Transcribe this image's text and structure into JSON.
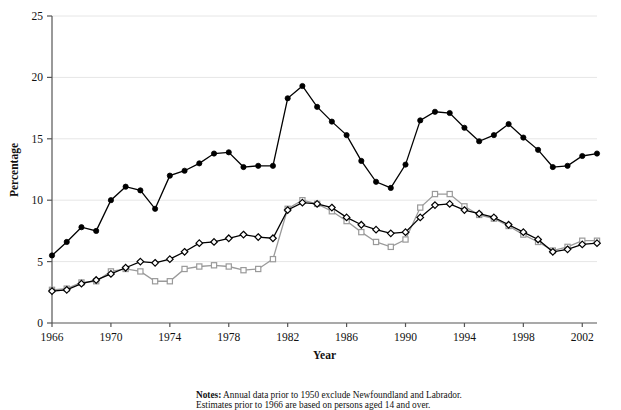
{
  "chart_data": {
    "type": "line",
    "title": "",
    "xlabel": "Year",
    "ylabel": "Percentage",
    "xlim": [
      1966,
      2003
    ],
    "ylim": [
      0,
      25
    ],
    "yticks": [
      0,
      5,
      10,
      15,
      20,
      25
    ],
    "xticks": [
      1966,
      1970,
      1974,
      1978,
      1982,
      1986,
      1990,
      1994,
      1998,
      2002
    ],
    "grid": "horizontal",
    "legend_position": "bottom",
    "x": [
      1966,
      1967,
      1968,
      1969,
      1970,
      1971,
      1972,
      1973,
      1974,
      1975,
      1976,
      1977,
      1978,
      1979,
      1980,
      1981,
      1982,
      1983,
      1984,
      1985,
      1986,
      1987,
      1988,
      1989,
      1990,
      1991,
      1992,
      1993,
      1994,
      1995,
      1996,
      1997,
      1998,
      1999,
      2000,
      2001,
      2002,
      2003
    ],
    "series": [
      {
        "name": "Youth 15-24",
        "marker": "filled-circle",
        "color": "#000000",
        "values": [
          5.5,
          6.6,
          7.8,
          7.5,
          10.0,
          11.1,
          10.8,
          9.3,
          12.0,
          12.4,
          13.0,
          13.8,
          13.9,
          12.7,
          12.8,
          12.8,
          18.3,
          19.3,
          17.6,
          16.4,
          15.3,
          13.2,
          11.5,
          11.0,
          12.9,
          16.5,
          17.2,
          17.1,
          15.9,
          14.8,
          15.3,
          16.2,
          15.1,
          14.1,
          12.7,
          12.8,
          13.6,
          13.8
        ]
      },
      {
        "name": "Men 25+",
        "marker": "open-square",
        "color": "#9a9a9a",
        "values": [
          2.7,
          2.8,
          3.3,
          3.4,
          4.2,
          4.4,
          4.2,
          3.4,
          3.4,
          4.4,
          4.6,
          4.7,
          4.6,
          4.3,
          4.4,
          5.2,
          9.3,
          10.0,
          9.7,
          9.1,
          8.3,
          7.4,
          6.6,
          6.2,
          6.8,
          9.4,
          10.5,
          10.5,
          9.5,
          8.8,
          8.5,
          7.9,
          7.2,
          6.6,
          5.9,
          6.2,
          6.7,
          6.7
        ]
      },
      {
        "name": "Women 25+",
        "marker": "open-diamond",
        "color": "#000000",
        "values": [
          2.6,
          2.7,
          3.2,
          3.5,
          4.0,
          4.5,
          5.0,
          4.9,
          5.2,
          5.8,
          6.5,
          6.6,
          6.9,
          7.2,
          7.0,
          6.9,
          9.2,
          9.8,
          9.7,
          9.4,
          8.6,
          8.0,
          7.6,
          7.3,
          7.4,
          8.6,
          9.6,
          9.7,
          9.2,
          8.9,
          8.6,
          8.0,
          7.4,
          6.8,
          5.8,
          6.0,
          6.4,
          6.5
        ]
      }
    ]
  },
  "axis": {
    "y_label": "Percentage",
    "x_label": "Year",
    "y_tick_labels": [
      "0",
      "5",
      "10",
      "15",
      "20",
      "25"
    ],
    "x_tick_labels": [
      "1966",
      "1970",
      "1974",
      "1978",
      "1982",
      "1986",
      "1990",
      "1994",
      "1998",
      "2002"
    ]
  },
  "legend": {
    "items": [
      {
        "label": "Youth 15–24",
        "marker": "filled-circle",
        "color": "#000000"
      },
      {
        "label": "Men 25+",
        "marker": "open-square",
        "color": "#9a9a9a"
      },
      {
        "label": "Women 25+",
        "marker": "open-diamond",
        "color": "#000000"
      }
    ]
  },
  "notes": {
    "heading": "Notes:",
    "line1": " Annual data prior to 1950 exclude Newfoundland and Labrador.",
    "line2": "Estimates prior to 1966 are based on persons aged 14 and over."
  }
}
